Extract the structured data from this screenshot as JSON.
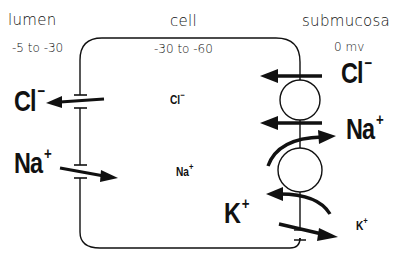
{
  "diagram": {
    "type": "epithelial-cell-ion-transport",
    "regions": {
      "lumen": {
        "label": "lumen",
        "potential": "-5 to -30"
      },
      "cell": {
        "label": "cell",
        "potential": "-30 to -60"
      },
      "submucosa": {
        "label": "submucosa",
        "potential": "0 mv"
      }
    },
    "ions": {
      "lumen_cl": {
        "symbol": "Cl",
        "charge": "−"
      },
      "lumen_na": {
        "symbol": "Na",
        "charge": "+"
      },
      "cell_cl": {
        "symbol": "Cl",
        "charge": "−"
      },
      "cell_na": {
        "symbol": "Na",
        "charge": "+"
      },
      "cell_k": {
        "symbol": "K",
        "charge": "+"
      },
      "sub_cl": {
        "symbol": "Cl",
        "charge": "−"
      },
      "sub_na": {
        "symbol": "Na",
        "charge": "+"
      },
      "sub_k": {
        "symbol": "K",
        "charge": "+"
      }
    },
    "transport": [
      {
        "membrane": "apical",
        "ion": "Cl-",
        "direction": "cell-to-lumen",
        "mechanism": "channel"
      },
      {
        "membrane": "apical",
        "ion": "Na+",
        "direction": "lumen-to-cell",
        "mechanism": "channel"
      },
      {
        "membrane": "basolateral",
        "ion": "Cl-",
        "direction": "submucosa-to-cell",
        "mechanism": "cotransporter"
      },
      {
        "membrane": "basolateral",
        "ion": "Na+",
        "direction": "submucosa-to-cell",
        "mechanism": "cotransporter"
      },
      {
        "membrane": "basolateral",
        "ion": "Na+",
        "direction": "cell-to-submucosa",
        "mechanism": "pump"
      },
      {
        "membrane": "basolateral",
        "ion": "K+",
        "direction": "submucosa-to-cell",
        "mechanism": "pump"
      },
      {
        "membrane": "basolateral",
        "ion": "K+",
        "direction": "cell-to-submucosa",
        "mechanism": "channel"
      }
    ],
    "colors": {
      "ink": "#111111",
      "background": "#ffffff"
    }
  }
}
